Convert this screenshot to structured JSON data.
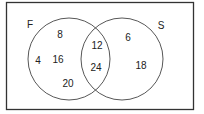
{
  "diagram": {
    "type": "venn",
    "sets": [
      {
        "name": "F",
        "label": "F"
      },
      {
        "name": "S",
        "label": "S"
      }
    ],
    "regions": {
      "F_only": [
        "8",
        "4",
        "16",
        "20"
      ],
      "F_and_S": [
        "12",
        "24"
      ],
      "S_only": [
        "6",
        "18"
      ]
    },
    "colors": {
      "stroke": "#333333",
      "background": "#ffffff"
    }
  }
}
